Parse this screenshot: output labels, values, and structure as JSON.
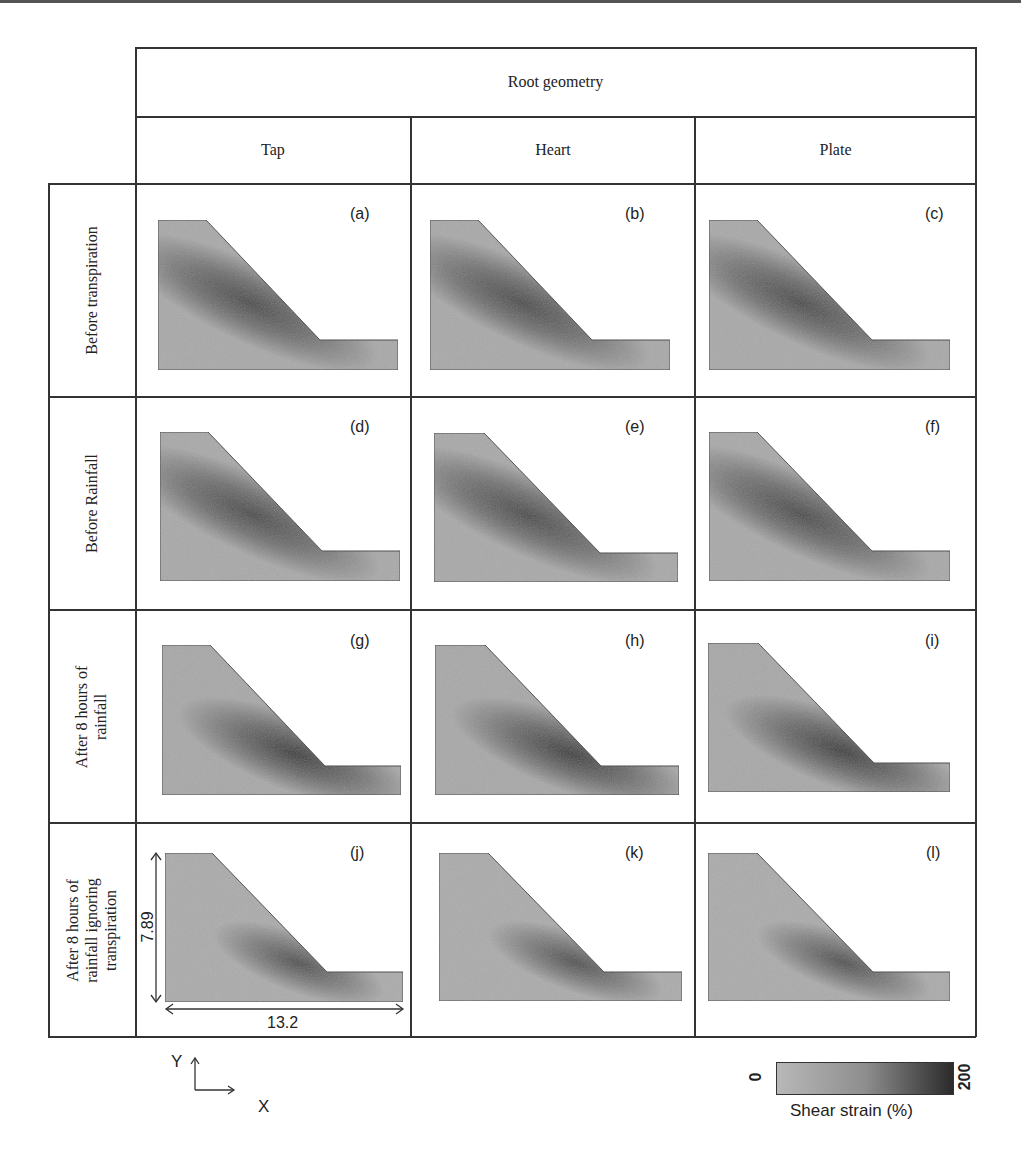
{
  "figure": {
    "header": {
      "title": "Root geometry",
      "columns": [
        "Tap",
        "Heart",
        "Plate"
      ]
    },
    "rows": [
      {
        "label": "Before transpiration",
        "panels": [
          "(a)",
          "(b)",
          "(c)"
        ]
      },
      {
        "label": "Before Rainfall",
        "panels": [
          "(d)",
          "(e)",
          "(f)"
        ]
      },
      {
        "label": "After 8 hours of\nrainfall",
        "panels": [
          "(g)",
          "(h)",
          "(i)"
        ]
      },
      {
        "label": "After 8 hours of\nrainfall ignoring\ntranspiration",
        "panels": [
          "(j)",
          "(k)",
          "(l)"
        ]
      }
    ],
    "dimensions": {
      "height": "7.89",
      "width": "13.2"
    },
    "axes": {
      "y": "Y",
      "x": "X"
    },
    "colorbar": {
      "min": "0",
      "max": "200",
      "label": "Shear strain (%)",
      "color_low": "#b8b8b8",
      "color_high": "#2a2a2a"
    }
  }
}
